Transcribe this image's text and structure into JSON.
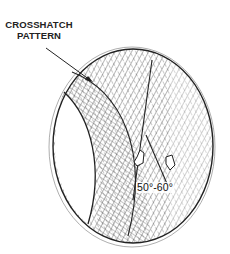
{
  "diagram": {
    "title_label": "CROSSHATCH\nPATTERN",
    "title_line1": "CROSSHATCH",
    "title_line2": "PATTERN",
    "angle_label": "50°-60°",
    "colors": {
      "ink": "#222222",
      "background": "#ffffff"
    }
  }
}
